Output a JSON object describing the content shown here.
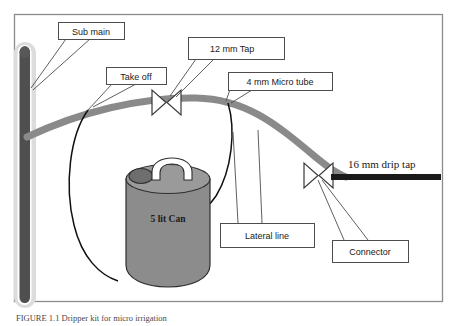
{
  "figure": {
    "border_color": "#8c8c8c",
    "background": "#ffffff",
    "caption": "FIGURE 1.1   Dripper kit for micro irrigation"
  },
  "palette": {
    "sub_main_pipe": "#4f4f4f",
    "sub_main_halo": "#d9d9d9",
    "lateral_pipe": "#8a8a8a",
    "can_body": "#8c8c8c",
    "can_top": "#9a9a9a",
    "can_cap": "#6e6e6e",
    "can_handle": "#ffffff",
    "drip_tap_pipe": "#1a1a1a",
    "label_border": "#4d4d4d",
    "leader_line": "#4d4d4d",
    "text": "#1a1a1a"
  },
  "labels": [
    {
      "id": "sub-main",
      "text": "Sub main",
      "x": 58,
      "y": 22,
      "w": 66,
      "h": 17
    },
    {
      "id": "take-off",
      "text": "Take off",
      "x": 106,
      "y": 67,
      "w": 60,
      "h": 17
    },
    {
      "id": "twelve-mm-tap",
      "text": "12 mm Tap",
      "x": 188,
      "y": 37,
      "w": 96,
      "h": 22
    },
    {
      "id": "micro-tube",
      "text": "4 mm Micro tube",
      "x": 228,
      "y": 72,
      "w": 104,
      "h": 18
    },
    {
      "id": "lateral-line",
      "text": "Lateral line",
      "x": 220,
      "y": 223,
      "w": 94,
      "h": 24
    },
    {
      "id": "connector",
      "text": "Connector",
      "x": 332,
      "y": 240,
      "w": 76,
      "h": 22
    }
  ],
  "free_labels": [
    {
      "id": "drip-tap",
      "text": "16 mm drip tap",
      "x": 348,
      "y": 164,
      "font_size": 11
    },
    {
      "id": "can-label",
      "text": "5 lit Can",
      "x": 165,
      "y": 216,
      "font_size": 9.5
    }
  ],
  "components": {
    "sub_main": {
      "name": "sub-main-pipe",
      "orientation": "vertical",
      "x": 18,
      "y_top": 45,
      "y_bottom": 305
    },
    "lateral": {
      "name": "lateral-line-pipe",
      "orientation": "arc",
      "from": "sub-main",
      "to": "16-mm-drip-tap"
    },
    "taps": [
      {
        "name": "12-mm-tap-valve",
        "cx": 166,
        "cy": 103,
        "type": "butterfly"
      },
      {
        "name": "16-mm-drip-tap-valve",
        "cx": 318,
        "cy": 175,
        "type": "butterfly"
      }
    ],
    "can": {
      "name": "five-litre-can",
      "cx": 168,
      "cy": 225,
      "rx": 42,
      "height": 112
    },
    "micro_tubes": 2,
    "drip_tap_pipe": {
      "name": "drip-tap-pipe",
      "x1": 330,
      "x2": 440,
      "y": 178
    }
  }
}
